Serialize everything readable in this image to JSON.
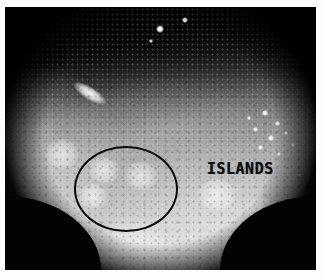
{
  "image": {
    "kind": "endoscopic-photograph",
    "modality": "white-light endoscopy",
    "color_mode": "grayscale",
    "border_color": "#ffffff",
    "frame_background": "#070707"
  },
  "annotations": {
    "label": {
      "text": "ISLANDS",
      "color": "#0d0d0d",
      "position": {
        "x": 202,
        "y": 155
      }
    },
    "marker_ellipse": {
      "name": "region-of-interest-ellipse",
      "stroke_color": "#0a0a0a",
      "stroke_width": 2,
      "x": 69,
      "y": 139,
      "width": 104,
      "height": 86
    }
  },
  "features": {
    "specular_highlights": [
      {
        "x": 155,
        "y": 22,
        "size": 7
      },
      {
        "x": 180,
        "y": 14,
        "size": 5
      },
      {
        "x": 146,
        "y": 35,
        "size": 3
      }
    ],
    "glare_streak": {
      "x": 66,
      "y": 80,
      "width": 38,
      "height": 13,
      "rotation": 32
    },
    "islands": [
      {
        "x": 88,
        "y": 155,
        "width": 30,
        "height": 24
      },
      {
        "x": 124,
        "y": 160,
        "width": 32,
        "height": 26
      },
      {
        "x": 78,
        "y": 182,
        "width": 28,
        "height": 22
      },
      {
        "x": 196,
        "y": 178,
        "width": 40,
        "height": 28
      },
      {
        "x": 244,
        "y": 196,
        "width": 36,
        "height": 26
      }
    ],
    "bubbles": [
      {
        "x": 262,
        "y": 108,
        "size": 5
      },
      {
        "x": 274,
        "y": 118,
        "size": 4
      },
      {
        "x": 252,
        "y": 124,
        "size": 4
      },
      {
        "x": 268,
        "y": 132,
        "size": 5
      },
      {
        "x": 283,
        "y": 127,
        "size": 3
      },
      {
        "x": 258,
        "y": 142,
        "size": 4
      },
      {
        "x": 276,
        "y": 148,
        "size": 3
      },
      {
        "x": 246,
        "y": 113,
        "size": 3
      },
      {
        "x": 290,
        "y": 139,
        "size": 3
      },
      {
        "x": 120,
        "y": 236,
        "size": 4
      },
      {
        "x": 136,
        "y": 244,
        "size": 3
      },
      {
        "x": 104,
        "y": 248,
        "size": 3
      },
      {
        "x": 188,
        "y": 232,
        "size": 3
      },
      {
        "x": 210,
        "y": 244,
        "size": 4
      },
      {
        "x": 58,
        "y": 250,
        "size": 3
      },
      {
        "x": 298,
        "y": 170,
        "size": 3
      }
    ]
  }
}
